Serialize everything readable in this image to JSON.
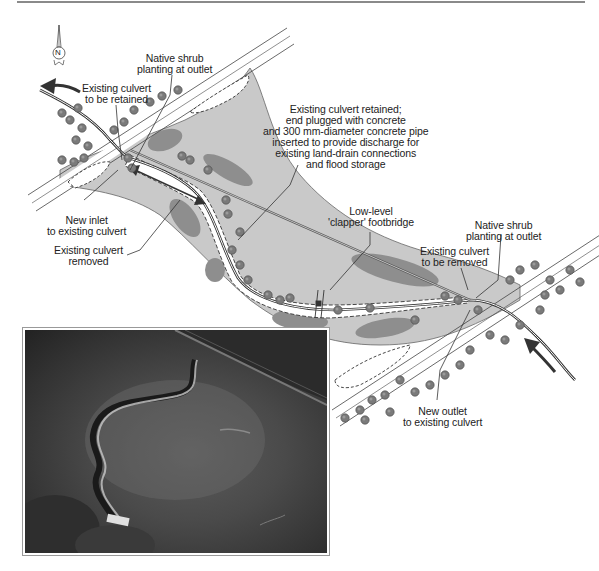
{
  "figure": {
    "north_arrow": {
      "letter": "N"
    },
    "labels": {
      "native_shrub_left": "Native shrub\nplanting at outlet",
      "existing_culvert_retained": "Existing culvert\nto be retained",
      "culvert_plugged_note": "Existing culvert retained;\nend plugged with concrete\nand 300 mm-diameter concrete pipe\ninserted to provide discharge for\nexisting land-drain connections\nand flood storage",
      "new_inlet": "New inlet\nto existing culvert",
      "existing_culvert_removed": "Existing culvert\nremoved",
      "clapper_footbridge": "Low-level\n'clapper' footbridge",
      "native_shrub_right": "Native shrub\nplanting at outlet",
      "existing_culvert_to_be_removed": "Existing culvert\nto be removed",
      "new_outlet": "New outlet\nto existing culvert"
    },
    "colors": {
      "floodplain": "#c9c9c9",
      "wet_patch": "#8e8e8e",
      "shrub": "#7a7a7a",
      "line": "#333333",
      "road": "#ffffff"
    }
  },
  "photo": {
    "description": "Aerial photograph of restored meandering channel in floodplain"
  }
}
